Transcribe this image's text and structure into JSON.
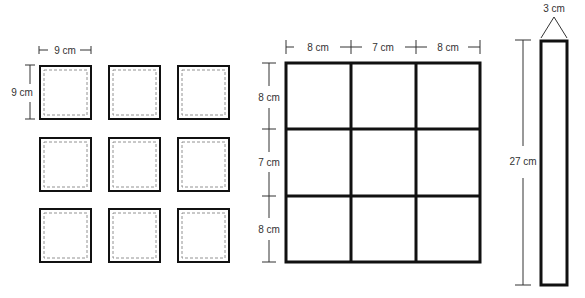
{
  "small_squares": {
    "width_label": "9 cm",
    "height_label": "9 cm",
    "count": 9
  },
  "grid": {
    "col_labels": [
      "8 cm",
      "7 cm",
      "8 cm"
    ],
    "row_labels": [
      "8 cm",
      "7 cm",
      "8 cm"
    ]
  },
  "strip": {
    "width_label": "3 cm",
    "height_label": "27 cm"
  },
  "colors": {
    "stroke": "#111111",
    "dim": "#333333"
  }
}
